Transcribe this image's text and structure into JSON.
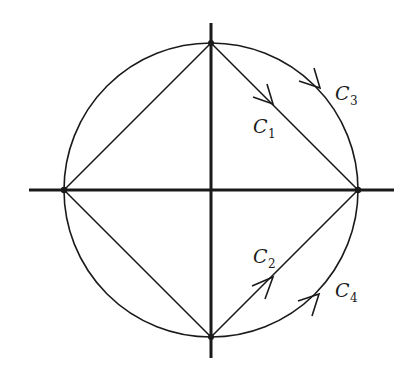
{
  "diagram": {
    "type": "contour-integration-paths",
    "stroke_color": "#1a1a1a",
    "background": "#ffffff",
    "center": {
      "x": 211,
      "y": 190
    },
    "radius": 147,
    "axes": {
      "horizontal": {
        "x1": 29,
        "x2": 394,
        "y": 190
      },
      "vertical": {
        "x": 211,
        "y1": 23,
        "y2": 358
      }
    },
    "points": [
      {
        "name": "top",
        "x": 211,
        "y": 43
      },
      {
        "name": "right",
        "x": 358,
        "y": 190
      },
      {
        "name": "bottom",
        "x": 211,
        "y": 337
      },
      {
        "name": "left",
        "x": 64,
        "y": 190
      }
    ],
    "paths": [
      {
        "id": "C1",
        "kind": "chord",
        "from": "top",
        "to": "right",
        "label": "C",
        "sub": "1"
      },
      {
        "id": "C2",
        "kind": "chord",
        "from": "bottom",
        "to": "right",
        "label": "C",
        "sub": "2"
      },
      {
        "id": "C3",
        "kind": "arc",
        "from": "top",
        "to": "right",
        "label": "C",
        "sub": "3"
      },
      {
        "id": "C4",
        "kind": "arc",
        "from": "bottom",
        "to": "right",
        "label": "C",
        "sub": "4"
      }
    ],
    "labels": {
      "c1": {
        "main": "C",
        "sub": "1"
      },
      "c2": {
        "main": "C",
        "sub": "2"
      },
      "c3": {
        "main": "C",
        "sub": "3"
      },
      "c4": {
        "main": "C",
        "sub": "4"
      }
    }
  }
}
